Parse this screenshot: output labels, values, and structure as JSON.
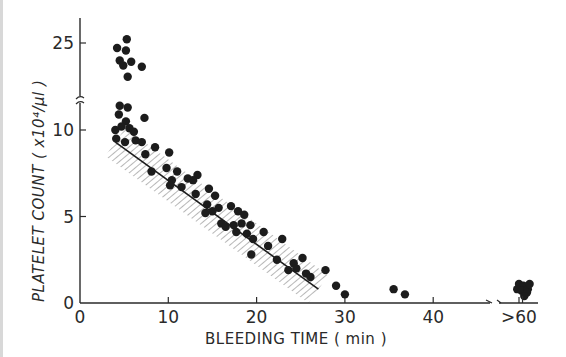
{
  "chart_data": {
    "type": "scatter",
    "title": "",
    "xlabel": "BLEEDING TIME ( min )",
    "ylabel": "PLATELET COUNT ( x10⁴/µl )",
    "x_ticks": [
      "0",
      "10",
      "20",
      "30",
      "40",
      ">60"
    ],
    "y_ticks": [
      "0",
      "5",
      "10",
      "25"
    ],
    "x_axis_break": "between 40 and >60",
    "y_axis_break": "between 10 and 25 (approx. 11-12)",
    "xlim": [
      0,
      62
    ],
    "ylim": [
      0,
      26
    ],
    "grid": false,
    "legend": null,
    "regression_line": {
      "from": {
        "x": 4,
        "y": 9.3
      },
      "to": {
        "x": 27,
        "y": 0.8
      },
      "confidence_band": "hatched band around regression line"
    },
    "series": [
      {
        "name": "patients",
        "points": [
          {
            "x": 5.3,
            "y": 25.3
          },
          {
            "x": 4.2,
            "y": 24.6
          },
          {
            "x": 5.2,
            "y": 24.4
          },
          {
            "x": 4.5,
            "y": 23.6
          },
          {
            "x": 5.8,
            "y": 23.5
          },
          {
            "x": 4.9,
            "y": 23.2
          },
          {
            "x": 7.0,
            "y": 23.1
          },
          {
            "x": 5.4,
            "y": 22.3
          },
          {
            "x": 4.5,
            "y": 11.4
          },
          {
            "x": 5.4,
            "y": 11.3
          },
          {
            "x": 4.4,
            "y": 10.9
          },
          {
            "x": 5.2,
            "y": 10.5
          },
          {
            "x": 7.3,
            "y": 10.7
          },
          {
            "x": 4.0,
            "y": 10.0
          },
          {
            "x": 4.7,
            "y": 10.2
          },
          {
            "x": 5.6,
            "y": 10.1
          },
          {
            "x": 6.1,
            "y": 9.9
          },
          {
            "x": 4.1,
            "y": 9.5
          },
          {
            "x": 5.1,
            "y": 9.3
          },
          {
            "x": 6.3,
            "y": 9.4
          },
          {
            "x": 7.0,
            "y": 9.3
          },
          {
            "x": 8.5,
            "y": 9.0
          },
          {
            "x": 10.1,
            "y": 8.7
          },
          {
            "x": 7.4,
            "y": 8.6
          },
          {
            "x": 8.1,
            "y": 7.6
          },
          {
            "x": 9.8,
            "y": 7.8
          },
          {
            "x": 11.0,
            "y": 7.6
          },
          {
            "x": 13.3,
            "y": 7.4
          },
          {
            "x": 10.4,
            "y": 7.1
          },
          {
            "x": 12.2,
            "y": 7.2
          },
          {
            "x": 12.8,
            "y": 7.1
          },
          {
            "x": 10.2,
            "y": 6.8
          },
          {
            "x": 11.5,
            "y": 6.7
          },
          {
            "x": 14.6,
            "y": 6.6
          },
          {
            "x": 13.1,
            "y": 6.3
          },
          {
            "x": 15.3,
            "y": 6.2
          },
          {
            "x": 14.4,
            "y": 5.7
          },
          {
            "x": 15.7,
            "y": 5.5
          },
          {
            "x": 17.1,
            "y": 5.6
          },
          {
            "x": 14.2,
            "y": 5.2
          },
          {
            "x": 15.0,
            "y": 5.3
          },
          {
            "x": 17.9,
            "y": 5.3
          },
          {
            "x": 18.6,
            "y": 5.1
          },
          {
            "x": 16.0,
            "y": 4.6
          },
          {
            "x": 16.5,
            "y": 4.4
          },
          {
            "x": 17.4,
            "y": 4.5
          },
          {
            "x": 18.3,
            "y": 4.6
          },
          {
            "x": 19.3,
            "y": 4.5
          },
          {
            "x": 20.8,
            "y": 4.1
          },
          {
            "x": 17.7,
            "y": 4.1
          },
          {
            "x": 18.9,
            "y": 4.0
          },
          {
            "x": 19.6,
            "y": 3.7
          },
          {
            "x": 22.9,
            "y": 3.7
          },
          {
            "x": 21.3,
            "y": 3.3
          },
          {
            "x": 19.4,
            "y": 2.8
          },
          {
            "x": 22.3,
            "y": 2.5
          },
          {
            "x": 24.2,
            "y": 2.3
          },
          {
            "x": 25.2,
            "y": 2.6
          },
          {
            "x": 24.5,
            "y": 2.0
          },
          {
            "x": 25.6,
            "y": 1.7
          },
          {
            "x": 26.1,
            "y": 1.5
          },
          {
            "x": 23.6,
            "y": 1.9
          },
          {
            "x": 27.8,
            "y": 1.9
          },
          {
            "x": 29.0,
            "y": 1.0
          },
          {
            "x": 30.0,
            "y": 0.5
          },
          {
            "x": 36.8,
            "y": 0.5
          },
          {
            "x": 45.8,
            "y": 0.8
          },
          {
            "x": 60.0,
            "y": 1.1
          },
          {
            "x": 60.5,
            "y": 1.0
          },
          {
            "x": 59.8,
            "y": 0.8
          },
          {
            "x": 60.3,
            "y": 0.7
          },
          {
            "x": 61.0,
            "y": 0.8
          },
          {
            "x": 60.9,
            "y": 0.6
          },
          {
            "x": 60.6,
            "y": 0.4
          },
          {
            "x": 61.2,
            "y": 1.1
          }
        ]
      }
    ]
  },
  "axes": {
    "x_title": "BLEEDING TIME ( min )",
    "y_title": "PLATELET COUNT ( x10⁴/µl )"
  },
  "colors": {
    "ink": "#1c1c1c",
    "axis": "#2a2a2a",
    "hatch": "#8a8a8a",
    "background": "#ffffff"
  }
}
